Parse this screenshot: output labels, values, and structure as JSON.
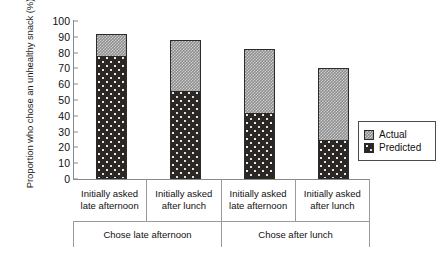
{
  "chart_data": {
    "type": "bar",
    "stacked": true,
    "title": "",
    "xlabel": "",
    "ylabel": "Proportion who chose an unhealthy snack (%)",
    "ylim": [
      0,
      100
    ],
    "yticks": [
      0,
      10,
      20,
      30,
      40,
      50,
      60,
      70,
      80,
      90,
      100
    ],
    "grid": false,
    "legend_position": "right",
    "categories": [
      "Initially asked late afternoon",
      "Initially asked after lunch",
      "Initially asked late afternoon",
      "Initially asked after lunch"
    ],
    "category_lines": [
      [
        "Initially asked",
        "late afternoon"
      ],
      [
        "Initially asked",
        "after lunch"
      ],
      [
        "Initially asked",
        "late afternoon"
      ],
      [
        "Initially asked",
        "after lunch"
      ]
    ],
    "groups": [
      {
        "label": "Chose late afternoon",
        "span": 2
      },
      {
        "label": "Chose after lunch",
        "span": 2
      }
    ],
    "series": [
      {
        "name": "Predicted",
        "values": [
          78,
          56,
          42,
          25
        ],
        "color": "#2a2724"
      },
      {
        "name": "Actual",
        "values": [
          92,
          88,
          82,
          70
        ],
        "color": "#a8a8a8",
        "note": "values are cumulative bar tops"
      }
    ],
    "bars": [
      {
        "category": "Initially asked late afternoon",
        "group": "Chose late afternoon",
        "predicted": 78,
        "actual_total": 92
      },
      {
        "category": "Initially asked after lunch",
        "group": "Chose late afternoon",
        "predicted": 56,
        "actual_total": 88
      },
      {
        "category": "Initially asked late afternoon",
        "group": "Chose after lunch",
        "predicted": 42,
        "actual_total": 82
      },
      {
        "category": "Initially asked after lunch",
        "group": "Chose after lunch",
        "predicted": 25,
        "actual_total": 70
      }
    ],
    "legend": [
      {
        "label": "Actual",
        "swatch": "light-checker"
      },
      {
        "label": "Predicted",
        "swatch": "dark-speckle"
      }
    ]
  }
}
